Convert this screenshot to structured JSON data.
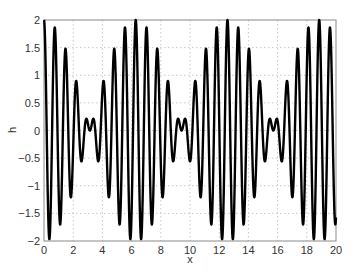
{
  "chart_data": {
    "type": "line",
    "title": "",
    "xlabel": "x",
    "ylabel": "h",
    "xlim": [
      0,
      20
    ],
    "ylim": [
      -2,
      2
    ],
    "xticks": [
      0,
      2,
      4,
      6,
      8,
      10,
      12,
      14,
      16,
      18,
      20
    ],
    "yticks": [
      -2,
      -1.5,
      -1,
      -0.5,
      0,
      0.5,
      1,
      1.5,
      2
    ],
    "ytick_labels": [
      "-2",
      "-1.5",
      "-1",
      "-0.5",
      "0",
      "0.5",
      "1",
      "1.5",
      "2"
    ],
    "grid": true,
    "legend": null,
    "series": [
      {
        "name": "h(x)",
        "color": "#000000",
        "description": "Beat-pattern oscillation approx. h = cos(8x) + cos(9x); envelope period ~2*pi, amplitude up to 2, near-zero nodes at x ~ 3.1, 9.4, 15.7",
        "formula_approx": "cos(8*x)+cos(9*x)",
        "samples": {
          "x_start": 0,
          "x_end": 20,
          "n": 2000
        }
      }
    ]
  },
  "axes": {
    "x_label": "x",
    "y_label": "h",
    "line_color": "#000000",
    "grid_color": "#c8c8c8",
    "frame_color": "#888888"
  }
}
